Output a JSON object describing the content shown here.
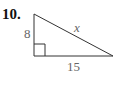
{
  "problem": {
    "number": "10.",
    "labels": {
      "left_side": "8",
      "bottom_side": "15",
      "hypotenuse": "x"
    }
  },
  "diagram": {
    "type": "right-triangle",
    "right_angle": "bottom-left",
    "stroke_color": "#333333",
    "label_color": "#666666"
  }
}
